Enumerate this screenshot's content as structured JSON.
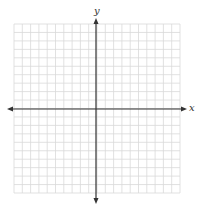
{
  "diagram": {
    "type": "coordinate-plane",
    "grid": {
      "columns": 20,
      "rows": 20,
      "left": 14,
      "top": 24,
      "right": 180,
      "bottom": 193,
      "line_color": "#d9d9d9"
    },
    "axes": {
      "color": "#333333",
      "x_axis_y": 109,
      "y_axis_x": 96,
      "x_label": "x",
      "y_label": "y"
    }
  }
}
